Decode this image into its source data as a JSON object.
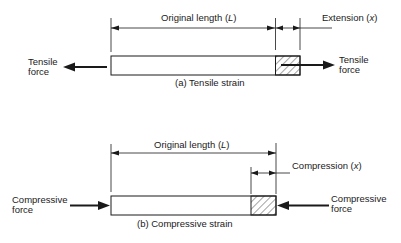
{
  "tensile": {
    "original_length_prefix": "Original length (",
    "original_length_symbol": "L",
    "original_length_suffix": ")",
    "extension_prefix": "Extension (",
    "extension_symbol": "x",
    "extension_suffix": ")",
    "left_force_line1": "Tensile",
    "left_force_line2": "force",
    "right_force_line1": "Tensile",
    "right_force_line2": "force",
    "caption": "(a) Tensile strain"
  },
  "compressive": {
    "original_length_prefix": "Original length (",
    "original_length_symbol": "L",
    "original_length_suffix": ")",
    "compression_prefix": "Compression (",
    "compression_symbol": "x",
    "compression_suffix": ")",
    "left_force_line1": "Compressive",
    "left_force_line2": "force",
    "right_force_line1": "Compressive",
    "right_force_line2": "force",
    "caption": "(b) Compressive strain"
  },
  "colors": {
    "ink": "#1a1a1a",
    "background": "#ffffff"
  }
}
